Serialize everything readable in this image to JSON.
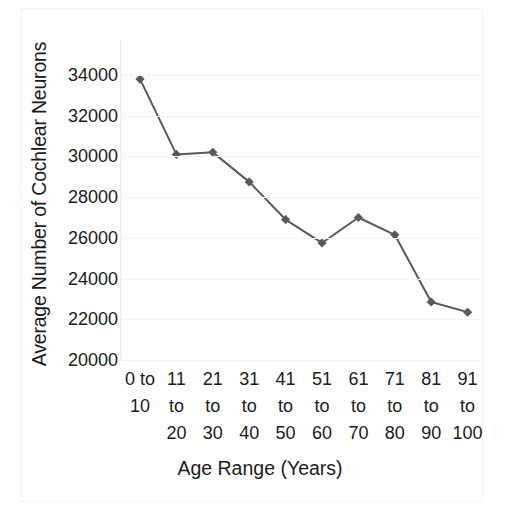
{
  "chart_data": {
    "type": "line",
    "title": "",
    "xlabel": "Age Range (Years)",
    "ylabel": "Average Number of Cochlear Neurons",
    "categories": [
      "0 to 10",
      "11 to 20",
      "21 to 30",
      "31 to 40",
      "41 to 50",
      "51 to 60",
      "61 to 70",
      "71 to 80",
      "81 to 90",
      "91 to 100"
    ],
    "category_lines": [
      [
        "0 to",
        "10"
      ],
      [
        "11",
        "to",
        "20"
      ],
      [
        "21",
        "to",
        "30"
      ],
      [
        "31",
        "to",
        "40"
      ],
      [
        "41",
        "to",
        "50"
      ],
      [
        "51",
        "to",
        "60"
      ],
      [
        "61",
        "to",
        "70"
      ],
      [
        "71",
        "to",
        "80"
      ],
      [
        "81",
        "to",
        "90"
      ],
      [
        "91",
        "to",
        "100"
      ]
    ],
    "values": [
      33800,
      30100,
      30200,
      28750,
      26900,
      25750,
      27000,
      26150,
      22850,
      22350
    ],
    "ylim": [
      20000,
      34000
    ],
    "yticks": [
      20000,
      22000,
      24000,
      26000,
      28000,
      30000,
      32000,
      34000
    ],
    "ytick_labels": [
      "20000",
      "22000",
      "24000",
      "26000",
      "28000",
      "30000",
      "32000",
      "34000"
    ],
    "grid": true,
    "legend": false,
    "series_color": "#595959",
    "marker": "diamond",
    "gridline_color": "#f2f2f2"
  }
}
